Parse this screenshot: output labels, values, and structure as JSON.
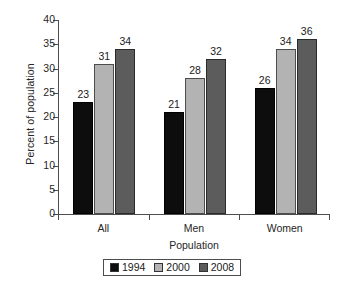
{
  "chart_data": {
    "type": "bar",
    "title": "",
    "subtitle": "",
    "categories": [
      "All",
      "Men",
      "Women"
    ],
    "series": [
      {
        "name": "1994",
        "color": "#0d0d0d",
        "values": [
          23,
          21,
          26
        ]
      },
      {
        "name": "2000",
        "color": "#b3b3b3",
        "values": [
          31,
          28,
          34
        ]
      },
      {
        "name": "2008",
        "color": "#5c5c5c",
        "values": [
          34,
          32,
          36
        ]
      }
    ],
    "xlabel": "Population",
    "ylabel": "Percent of population",
    "ylim": [
      0,
      40
    ],
    "ytick_labels": [
      "0",
      "5",
      "10",
      "15",
      "20",
      "25",
      "30",
      "35",
      "40"
    ],
    "ytick_values": [
      0,
      5,
      10,
      15,
      20,
      25,
      30,
      35,
      40
    ],
    "grid": false,
    "legend_position": "bottom",
    "value_labels_shown": true,
    "value_labels": [
      [
        "23",
        "31",
        "34"
      ],
      [
        "21",
        "28",
        "32"
      ],
      [
        "26",
        "34",
        "36"
      ]
    ]
  },
  "legend": {
    "items": [
      {
        "label": "1994",
        "color": "#0d0d0d"
      },
      {
        "label": "2000",
        "color": "#b3b3b3"
      },
      {
        "label": "2008",
        "color": "#5c5c5c"
      }
    ]
  }
}
